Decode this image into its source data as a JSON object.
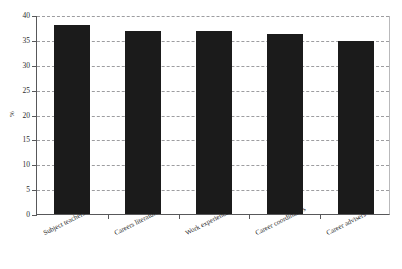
{
  "chart_data": {
    "type": "bar",
    "title": "",
    "xlabel": "",
    "ylabel": "%",
    "categories": [
      "Subject teachers",
      "Careers literature",
      "Work experience",
      "Career coordinators",
      "Career advisers"
    ],
    "values": [
      38,
      36.8,
      36.8,
      36.2,
      34.8
    ],
    "ylim": [
      0,
      40
    ],
    "ytick_labels": [
      "0",
      "5",
      "10",
      "15",
      "20",
      "25",
      "30",
      "35",
      "40"
    ],
    "ytick_values": [
      0,
      5,
      10,
      15,
      20,
      25,
      30,
      35,
      40
    ],
    "grid": true,
    "grid_style": "dashed-horizontal",
    "legend": "none",
    "bar_color": "#1b1b1b",
    "axis_color": "#58585a",
    "grid_color": "#8d8d90",
    "background_color": "#ffffff"
  }
}
